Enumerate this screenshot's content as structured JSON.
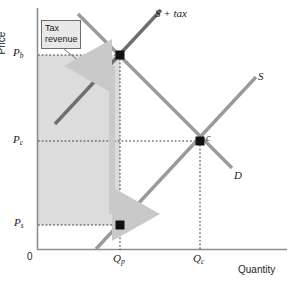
{
  "figure": {
    "type": "economics-supply-demand-tax-diagram",
    "axes": {
      "y_title": "Price",
      "x_title": "Quantity",
      "origin_label": "0"
    },
    "price_ticks": [
      {
        "id": "pb",
        "base": "P",
        "sub": "b",
        "y_px": 55,
        "meaning": "price paid by buyers"
      },
      {
        "id": "pc",
        "base": "P",
        "sub": "c",
        "y_px": 141,
        "meaning": "competitive equilibrium price"
      },
      {
        "id": "ps",
        "base": "P",
        "sub": "s",
        "y_px": 225,
        "meaning": "price received by sellers"
      }
    ],
    "quantity_ticks": [
      {
        "id": "qp",
        "base": "Q",
        "sub": "p",
        "x_px": 120,
        "meaning": "quantity with tax"
      },
      {
        "id": "qc",
        "base": "Q",
        "sub": "c",
        "x_px": 200,
        "meaning": "competitive quantity"
      }
    ],
    "curves": [
      {
        "id": "s-plus-tax",
        "label": "S + tax",
        "color": "#6e6e6e",
        "width": 3.4,
        "x1": 55,
        "y1": 124,
        "x2": 161,
        "y2": 10
      },
      {
        "id": "supply",
        "label": "S",
        "color": "#9a9a9a",
        "width": 3.4,
        "x1": 96,
        "y1": 249,
        "x2": 256,
        "y2": 77
      },
      {
        "id": "demand",
        "label": "D",
        "color": "#9a9a9a",
        "width": 3.4,
        "x1": 78,
        "y1": 14,
        "x2": 232,
        "y2": 168
      }
    ],
    "points": [
      {
        "id": "tax-equilibrium",
        "label": "",
        "x_px": 120,
        "y_px": 55
      },
      {
        "id": "seller-price-point",
        "label": "",
        "x_px": 120,
        "y_px": 225
      },
      {
        "id": "competitive-equilibrium",
        "label": "c",
        "x_px": 200,
        "y_px": 141
      }
    ],
    "shaded_region": {
      "id": "tax-revenue-area",
      "fill": "#dcdcdc",
      "x": 38,
      "y": 55,
      "width": 82,
      "height": 170
    },
    "callout": {
      "id": "tax-revenue-callout",
      "line1": "Tax",
      "line2": "revenue",
      "fill": "#e8e8e8",
      "border": "#6e6e6e"
    },
    "annotation_arrow": {
      "id": "tax-wedge-arrow",
      "color": "#c9c9c9",
      "x_px": 112,
      "y_top": 58,
      "y_bottom": 222,
      "double_headed": true,
      "meaning": "vertical distance equals the per-unit tax"
    },
    "colors": {
      "axis": "#8f8f8f",
      "guide_line": "#3a3a3a",
      "point": "#111111",
      "background": "#ffffff"
    }
  }
}
